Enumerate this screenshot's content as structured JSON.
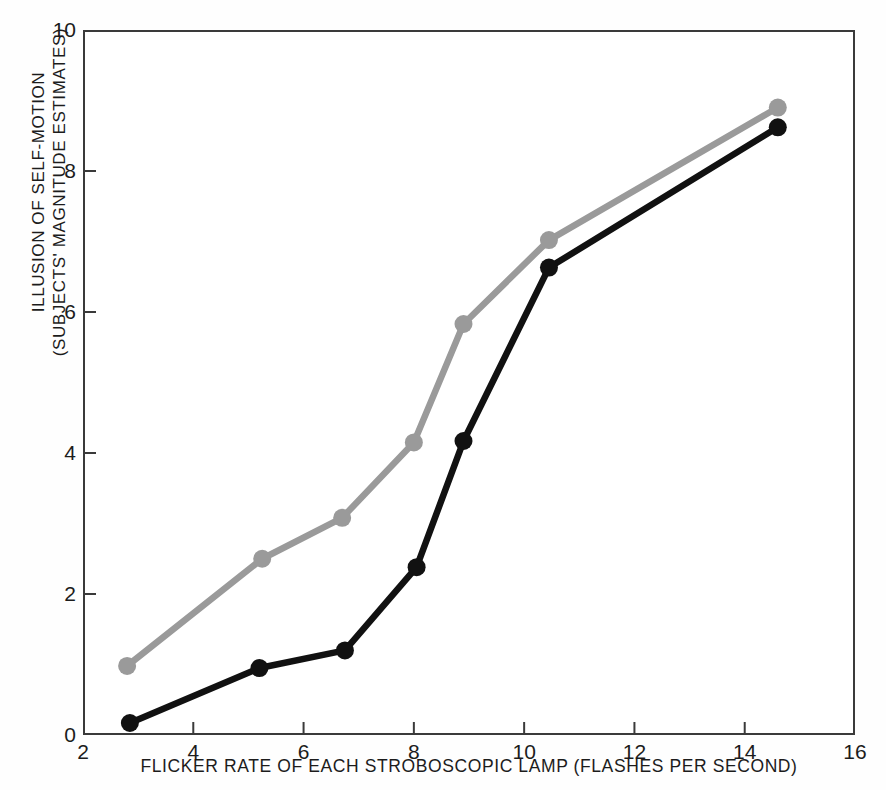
{
  "chart_data": {
    "type": "line",
    "title": "",
    "subtitle": "",
    "xlabel": "FLICKER RATE OF EACH STROBOSCOPIC LAMP (FLASHES PER SECOND)",
    "ylabel_line1": "ILLUSION OF SELF-MOTION",
    "ylabel_line2": "(SUBJECTS' MAGNITUDE ESTIMATES)",
    "xlim": [
      2,
      16
    ],
    "ylim": [
      0,
      10
    ],
    "xticks": [
      2,
      4,
      6,
      8,
      10,
      12,
      14,
      16
    ],
    "yticks": [
      0,
      2,
      4,
      6,
      8,
      10
    ],
    "xtick_labels": [
      "2",
      "4",
      "6",
      "8",
      "10",
      "12",
      "14",
      "16"
    ],
    "ytick_labels": [
      "0",
      "2",
      "4",
      "6",
      "8",
      "10"
    ],
    "grid": false,
    "legend": "none",
    "marker": "filled-circle",
    "series": [
      {
        "name": "gray-series",
        "color": "#9a9a9a",
        "x": [
          2.8,
          5.25,
          6.7,
          8.0,
          8.9,
          10.45,
          14.6
        ],
        "y": [
          0.98,
          2.5,
          3.08,
          4.15,
          5.83,
          7.02,
          8.9
        ]
      },
      {
        "name": "black-series",
        "color": "#111111",
        "x": [
          2.85,
          5.2,
          6.75,
          8.05,
          8.9,
          10.45,
          14.6
        ],
        "y": [
          0.17,
          0.95,
          1.2,
          2.38,
          4.17,
          6.63,
          8.62
        ]
      }
    ]
  },
  "figure": {
    "background_color": "#ffffff",
    "axis_color": "#3a3a3a",
    "text_color": "#1c1c1c"
  }
}
